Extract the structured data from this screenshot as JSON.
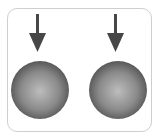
{
  "diagram": {
    "colors": {
      "frame": "#cfcfcf",
      "arrow": "#474747",
      "sphere_highlight": "#bdbdbd",
      "sphere_mid": "#8a8a8a",
      "sphere_edge": "#4f4f4f"
    },
    "items": [
      {
        "name": "left",
        "arrow_icon": "arrow-down-icon",
        "shape": "sphere"
      },
      {
        "name": "right",
        "arrow_icon": "arrow-down-icon",
        "shape": "sphere"
      }
    ]
  }
}
